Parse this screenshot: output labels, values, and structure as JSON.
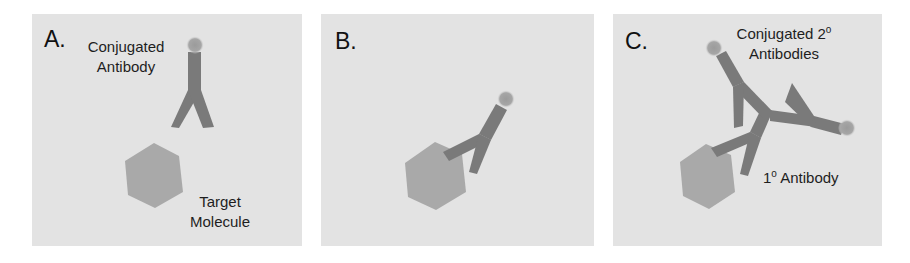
{
  "figure": {
    "colors": {
      "panel_background": "#e3e3e3",
      "antibody": "#7a7a7a",
      "target_molecule": "#a9a9a9",
      "conjugate_dot": "#a3a3a3",
      "text": "#1e1e1e"
    },
    "panels": [
      {
        "id": "A",
        "letter": "A.",
        "labels": {
          "antibody_line1": "Conjugated",
          "antibody_line2": "Antibody",
          "target_line1": "Target",
          "target_line2": "Molecule"
        }
      },
      {
        "id": "B",
        "letter": "B."
      },
      {
        "id": "C",
        "letter": "C.",
        "labels": {
          "secondary_line1": "Conjugated 2",
          "secondary_sup": "o",
          "secondary_line2": "Antibodies",
          "primary_prefix": "1",
          "primary_sup": "o",
          "primary_suffix": " Antibody"
        }
      }
    ]
  }
}
